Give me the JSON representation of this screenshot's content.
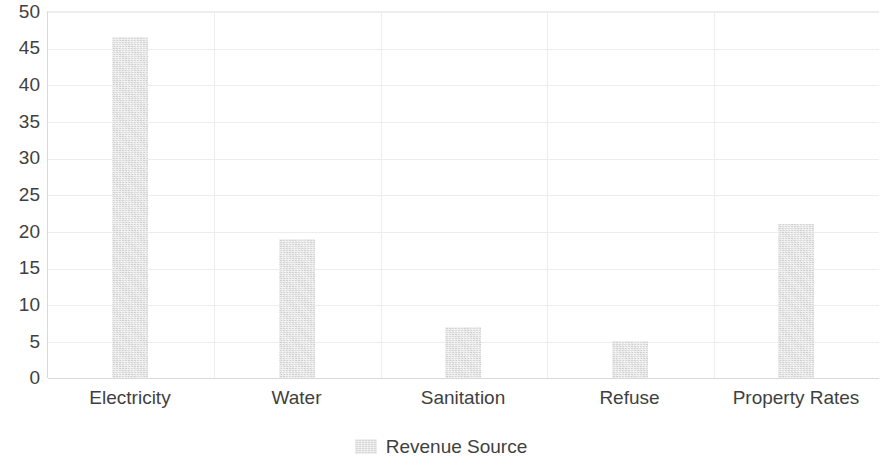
{
  "chart_data": {
    "type": "bar",
    "title": "",
    "subtitle": "",
    "xlabel": "",
    "ylabel": "",
    "categories": [
      "Electricity",
      "Water",
      "Sanitation",
      "Refuse",
      "Property Rates"
    ],
    "series": [
      {
        "name": "Revenue Source",
        "values": [
          46.6,
          19.0,
          7.0,
          5.0,
          21.0
        ],
        "color": "#d6d6d6"
      }
    ],
    "ylim": [
      0,
      50
    ],
    "ytick_labels": [
      "50",
      "45",
      "40",
      "35",
      "30",
      "25",
      "20",
      "15",
      "10",
      "5",
      "0"
    ],
    "ytick_values": [
      50,
      45,
      40,
      35,
      30,
      25,
      20,
      15,
      10,
      5,
      0
    ],
    "grid": {
      "horizontal": true,
      "vertical": true,
      "color": "#ededed"
    },
    "legend": {
      "position": "bottom-center",
      "entries": [
        {
          "label": "Revenue Source",
          "swatch_color": "#d6d6d6",
          "icon": "legend-swatch-icon"
        }
      ]
    },
    "axis_color": "#d9d9d9",
    "text_color": "#3f3f3f",
    "background": "#ffffff"
  }
}
